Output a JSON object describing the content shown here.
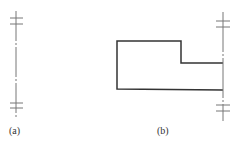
{
  "figure": {
    "panels": [
      {
        "id": "a",
        "label": "(a)",
        "description": "vertical axis line with double-tick break marks at top and bottom"
      },
      {
        "id": "b",
        "label": "(b)",
        "description": "stepped rectangular outline attached to vertical axis line with double-tick break marks"
      }
    ]
  },
  "colors": {
    "stroke": "#333333",
    "axis": "#666666",
    "background": "#ffffff"
  }
}
